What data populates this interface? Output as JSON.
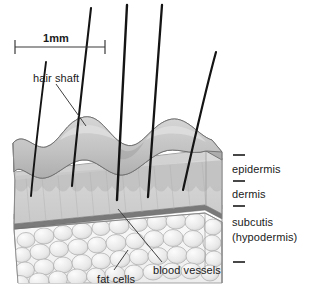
{
  "diagram": {
    "background_color": "#ffffff",
    "ink_color": "#1a1a1a"
  },
  "scale_bar": {
    "label": "1mm",
    "x_start": 15,
    "x_end": 105,
    "y": 47
  },
  "labels": {
    "hair_shaft": "hair shaft",
    "epidermis": "epidermis",
    "dermis": "dermis",
    "subcutis": "subcutis",
    "hypodermis": "(hypodermis)",
    "fat_cells": "fat cells",
    "blood_vessels": "blood vessels"
  },
  "layers": [
    {
      "name": "epidermis",
      "fill": "#c2c2c2",
      "stroke": "#6b6b6b"
    },
    {
      "name": "dermis",
      "fill": "#d4d4d4",
      "stroke": "#6b6b6b"
    },
    {
      "name": "subcutis",
      "fill": "#f2f2f2",
      "stroke": "#8a8a8a"
    }
  ],
  "hairs": [
    {
      "tip_x": 46,
      "tip_y": 62,
      "root_x": 31,
      "root_y": 196
    },
    {
      "tip_x": 91,
      "tip_y": 8,
      "root_x": 72,
      "root_y": 186
    },
    {
      "tip_x": 127,
      "tip_y": 5,
      "root_x": 117,
      "root_y": 200
    },
    {
      "tip_x": 162,
      "tip_y": 5,
      "root_x": 148,
      "root_y": 197
    },
    {
      "tip_x": 216,
      "tip_y": 52,
      "root_x": 183,
      "root_y": 190
    }
  ],
  "tick_marks": [
    {
      "name": "epidermis-tick",
      "x": 233,
      "y": 155,
      "width": 12
    },
    {
      "name": "dermis-tick",
      "x": 233,
      "y": 180,
      "width": 12
    },
    {
      "name": "subcutis-tick",
      "x": 233,
      "y": 205,
      "width": 12
    },
    {
      "name": "bottom-tick",
      "x": 233,
      "y": 262,
      "width": 12
    }
  ],
  "colors": {
    "epidermis_fill": "#c2c2c2",
    "dermis_fill": "#d9d9d9",
    "subcutis_fill": "#f4f4f4",
    "fat_cell_fill": "#ececec",
    "fat_cell_stroke": "#a8a8a8",
    "vessel_band": "#7d7d7d",
    "hair_color": "#141414",
    "leader_line": "#4a4a4a"
  }
}
